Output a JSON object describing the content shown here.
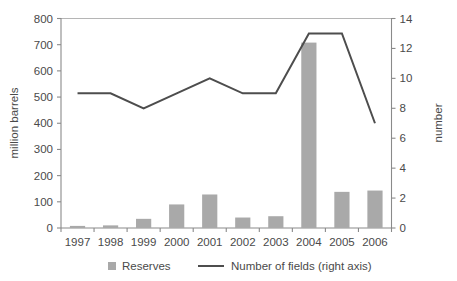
{
  "chart_data": {
    "type": "bar",
    "title": "",
    "xlabel": "",
    "ylabel": "million barrels",
    "y2label": "number",
    "categories": [
      "1997",
      "1998",
      "1999",
      "2000",
      "2001",
      "2002",
      "2003",
      "2004",
      "2005",
      "2006"
    ],
    "ylim": [
      0,
      800
    ],
    "y2lim": [
      0,
      14
    ],
    "yticks": [
      0,
      100,
      200,
      300,
      400,
      500,
      600,
      700,
      800
    ],
    "y2ticks": [
      0,
      2,
      4,
      6,
      8,
      10,
      12,
      14
    ],
    "grid": false,
    "legend_position": "bottom",
    "series": [
      {
        "name": "Reserves",
        "type": "bar",
        "axis": "left",
        "color": "#a9a9a9",
        "values": [
          8,
          10,
          35,
          90,
          128,
          40,
          45,
          708,
          138,
          143
        ]
      },
      {
        "name": "Number of fields (right axis)",
        "type": "line",
        "axis": "right",
        "color": "#4d4d4d",
        "values": [
          9,
          9,
          8,
          9,
          10,
          9,
          9,
          13,
          13,
          7
        ]
      }
    ]
  },
  "axes": {
    "left": {
      "title": "million barrels",
      "tick_labels": [
        "800",
        "700",
        "600",
        "500",
        "400",
        "300",
        "200",
        "100",
        "0"
      ]
    },
    "right": {
      "title": "number",
      "tick_labels": [
        "14",
        "12",
        "10",
        "8",
        "6",
        "4",
        "2",
        "0"
      ]
    },
    "bottom": {
      "tick_labels": [
        "1997",
        "1998",
        "1999",
        "2000",
        "2001",
        "2002",
        "2003",
        "2004",
        "2005",
        "2006"
      ]
    }
  },
  "legend": {
    "items": [
      {
        "label": "Reserves",
        "marker": "square-swatch",
        "color": "#a9a9a9"
      },
      {
        "label": "Number of fields (right axis)",
        "marker": "line-swatch",
        "color": "#4d4d4d"
      }
    ]
  }
}
